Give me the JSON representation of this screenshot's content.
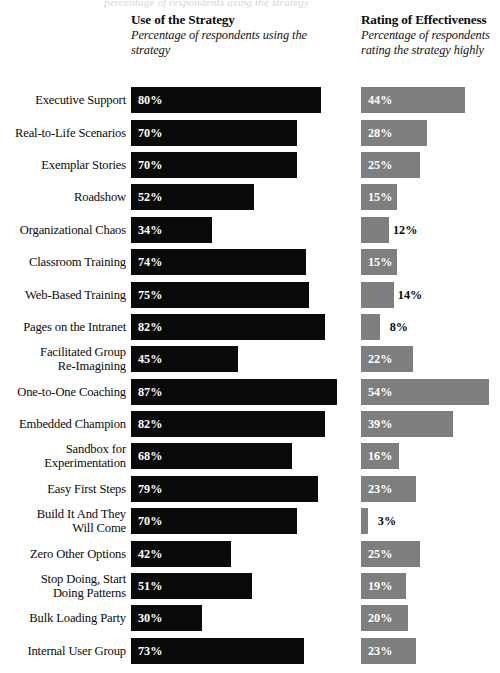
{
  "top_clipped_caption": "percentage of respondents using the strategy",
  "columns": {
    "use": {
      "title": "Use of the Strategy",
      "subtitle": "Percentage of respondents\nusing the strategy",
      "color": "#0a0a0a"
    },
    "rating": {
      "title": "Rating of Effectiveness",
      "subtitle": "Percentage of respondents\nrating the strategy highly",
      "color": "#7e7e7e"
    }
  },
  "chart_data": {
    "type": "bar",
    "xlabel": "Percentage of respondents",
    "ylabel": "",
    "xlim": [
      0,
      100
    ],
    "grid": false,
    "legend_position": "top",
    "orientation": "horizontal",
    "categories": [
      "Executive Support",
      "Real-to-Life Scenarios",
      "Exemplar Stories",
      "Roadshow",
      "Organizational Chaos",
      "Classroom Training",
      "Web-Based Training",
      "Pages on the Intranet",
      "Facilitated Group\nRe-Imagining",
      "One-to-One Coaching",
      "Embedded Champion",
      "Sandbox for\nExperimentation",
      "Easy First Steps",
      "Build It And They\nWill Come",
      "Zero Other Options",
      "Stop Doing, Start\nDoing Patterns",
      "Bulk Loading Party",
      "Internal User Group"
    ],
    "series": [
      {
        "name": "Use of the Strategy",
        "color": "#0a0a0a",
        "values": [
          80,
          70,
          70,
          52,
          34,
          74,
          75,
          82,
          45,
          87,
          82,
          68,
          79,
          70,
          42,
          51,
          30,
          73
        ],
        "labels": [
          "80%",
          "70%",
          "70%",
          "52%",
          "34%",
          "74%",
          "75%",
          "82%",
          "45%",
          "87%",
          "82%",
          "68%",
          "79%",
          "70%",
          "42%",
          "51%",
          "30%",
          "73%"
        ]
      },
      {
        "name": "Rating of Effectiveness",
        "color": "#7e7e7e",
        "values": [
          44,
          28,
          25,
          15,
          12,
          15,
          14,
          8,
          22,
          54,
          39,
          16,
          23,
          3,
          25,
          19,
          20,
          23
        ],
        "labels": [
          "44%",
          "28%",
          "25%",
          "15%",
          "12%",
          "15%",
          "14%",
          "8%",
          "22%",
          "54%",
          "39%",
          "16%",
          "23%",
          "3%",
          "25%",
          "19%",
          "20%",
          "23%"
        ]
      }
    ]
  }
}
